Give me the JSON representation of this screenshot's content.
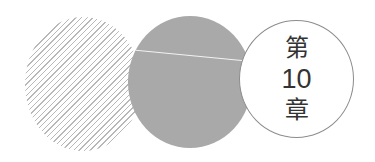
{
  "graphic": {
    "description": "Three overlapping circles chapter marker",
    "circles": [
      {
        "name": "hatched-circle",
        "style": "diagonal-hatch",
        "color": "#b8b8b8"
      },
      {
        "name": "solid-circle",
        "style": "solid-fill",
        "color": "#a9a9a9"
      },
      {
        "name": "outline-circle",
        "style": "outline",
        "color": "#8c8c8c"
      }
    ]
  },
  "chapter": {
    "prefix": "第",
    "number": "10",
    "suffix": "章",
    "text_color": "#333333"
  }
}
